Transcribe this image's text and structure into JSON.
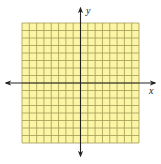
{
  "diagram": {
    "type": "coordinate-grid",
    "title": "",
    "grid": {
      "columns": 16,
      "rows": 16,
      "cells_left_of_y_axis": 8,
      "cells_right_of_y_axis": 8,
      "cells_above_x_axis": 8,
      "cells_below_x_axis": 8,
      "fill_color": "#fbf6a6",
      "line_color": "#a39b55"
    },
    "axes": {
      "x_label": "x",
      "y_label": "y",
      "color": "#222222",
      "arrows": [
        "left",
        "right",
        "up",
        "down"
      ],
      "tick_labels": []
    }
  },
  "chart_data": {
    "type": "scatter",
    "title": "",
    "xlabel": "x",
    "ylabel": "y",
    "x": [],
    "y": [],
    "xlim": [
      -8,
      8
    ],
    "ylim": [
      -8,
      8
    ],
    "grid": true,
    "legend": null
  }
}
